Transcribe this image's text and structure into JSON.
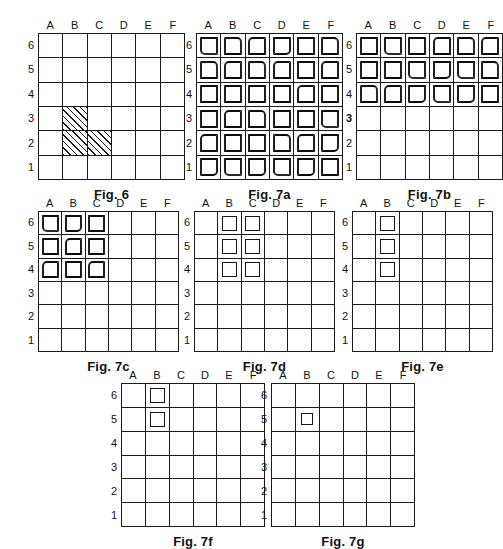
{
  "sheet": {
    "grid_columns": [
      "A",
      "B",
      "C",
      "D",
      "E",
      "F"
    ],
    "grid_rows": [
      "6",
      "5",
      "4",
      "3",
      "2",
      "1"
    ],
    "ink_color": "#1a1a1a",
    "background_color": "#ffffff"
  },
  "figures": [
    {
      "id": "fig-6",
      "caption": "Fig. 6",
      "columns": [
        "A",
        "B",
        "C",
        "D",
        "E",
        "F"
      ],
      "rows": [
        "6",
        "5",
        "4",
        "3",
        "2",
        "1"
      ],
      "marker_style": "hatch",
      "marked_cells": [
        "B3",
        "B2",
        "C2"
      ],
      "emphasized_row": null
    },
    {
      "id": "fig-7a",
      "caption": "Fig. 7a",
      "columns": [
        "A",
        "B",
        "C",
        "D",
        "E",
        "F"
      ],
      "rows": [
        "6",
        "5",
        "4",
        "3",
        "2",
        "1"
      ],
      "marker_style": "square-rough",
      "marked_cells": [
        "A6",
        "B6",
        "C6",
        "D6",
        "E6",
        "F6",
        "A5",
        "B5",
        "C5",
        "D5",
        "E5",
        "F5",
        "A4",
        "B4",
        "C4",
        "D4",
        "E4",
        "F4",
        "A3",
        "B3",
        "C3",
        "D3",
        "E3",
        "F3",
        "A2",
        "B2",
        "C2",
        "D2",
        "E2",
        "F2",
        "A1",
        "B1",
        "C1",
        "D1",
        "E1",
        "F1"
      ],
      "emphasized_row": null
    },
    {
      "id": "fig-7b",
      "caption": "Fig. 7b",
      "columns": [
        "A",
        "B",
        "C",
        "D",
        "E",
        "F"
      ],
      "rows": [
        "6",
        "5",
        "4",
        "3",
        "2",
        "1"
      ],
      "marker_style": "square-rough",
      "marked_cells": [
        "A6",
        "B6",
        "C6",
        "D6",
        "E6",
        "F6",
        "A5",
        "B5",
        "C5",
        "D5",
        "E5",
        "F5",
        "A4",
        "B4",
        "C4",
        "D4",
        "E4",
        "F4"
      ],
      "emphasized_row": "3"
    },
    {
      "id": "fig-7c",
      "caption": "Fig. 7c",
      "columns": [
        "A",
        "B",
        "C",
        "D",
        "E",
        "F"
      ],
      "rows": [
        "6",
        "5",
        "4",
        "3",
        "2",
        "1"
      ],
      "marker_style": "square-rough",
      "marked_cells": [
        "A6",
        "B6",
        "C6",
        "A5",
        "B5",
        "C5",
        "A4",
        "B4",
        "C4"
      ],
      "emphasized_row": null
    },
    {
      "id": "fig-7d",
      "caption": "Fig. 7d",
      "columns": [
        "A",
        "B",
        "C",
        "D",
        "E",
        "F"
      ],
      "rows": [
        "6",
        "5",
        "4",
        "3",
        "2",
        "1"
      ],
      "marker_style": "square-clean",
      "marked_cells": [
        "B6",
        "C6",
        "B5",
        "C5",
        "B4",
        "C4"
      ],
      "emphasized_row": null
    },
    {
      "id": "fig-7e",
      "caption": "Fig. 7e",
      "columns": [
        "A",
        "B",
        "C",
        "D",
        "E",
        "F"
      ],
      "rows": [
        "6",
        "5",
        "4",
        "3",
        "2",
        "1"
      ],
      "marker_style": "square-clean",
      "marked_cells": [
        "B6",
        "B5",
        "B4"
      ],
      "emphasized_row": null
    },
    {
      "id": "fig-7f",
      "caption": "Fig. 7f",
      "columns": [
        "A",
        "B",
        "C",
        "D",
        "E",
        "F"
      ],
      "rows": [
        "6",
        "5",
        "4",
        "3",
        "2",
        "1"
      ],
      "marker_style": "square-clean",
      "marked_cells": [
        "B6",
        "B5"
      ],
      "emphasized_row": null
    },
    {
      "id": "fig-7g",
      "caption": "Fig. 7g",
      "columns": [
        "A",
        "B",
        "C",
        "D",
        "E",
        "F"
      ],
      "rows": [
        "6",
        "5",
        "4",
        "3",
        "2",
        "1"
      ],
      "marker_style": "square-small",
      "marked_cells": [
        "B5"
      ],
      "emphasized_row": null
    }
  ],
  "layout": {
    "rows": [
      {
        "figure_ids": [
          "fig-6",
          "fig-7a",
          "fig-7b"
        ]
      },
      {
        "figure_ids": [
          "fig-7c",
          "fig-7d",
          "fig-7e"
        ]
      },
      {
        "figure_ids": [
          "fig-7f",
          "fig-7g"
        ]
      }
    ]
  }
}
